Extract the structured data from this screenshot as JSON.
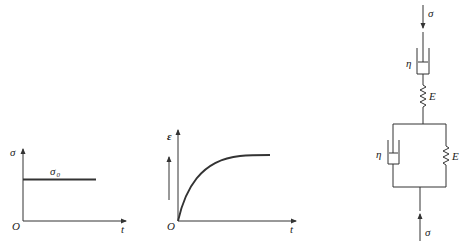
{
  "figure": {
    "panel_a": {
      "title": "stress-time",
      "y_label": "σ",
      "x_label": "t",
      "origin_label": "O",
      "level_label": "σ",
      "level_subscript": "0"
    },
    "panel_b": {
      "title": "strain-time",
      "y_label": "ε",
      "x_label": "t",
      "origin_label": "O"
    },
    "panel_c": {
      "title": "Burgers model",
      "top_load_label": "σ",
      "bottom_load_label": "σ",
      "series_dashpot_label": "η",
      "series_spring_label": "E",
      "parallel_dashpot_label": "η",
      "parallel_spring_label": "E"
    }
  }
}
